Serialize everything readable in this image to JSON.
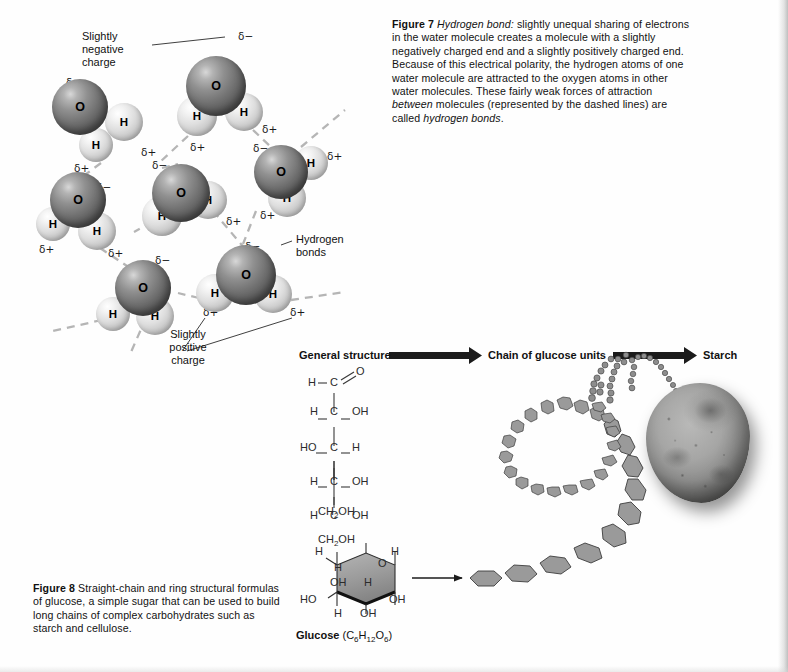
{
  "figure7": {
    "caption_label": "Figure 7",
    "caption_term": "Hydrogen bond:",
    "caption_body_1": " slightly unequal sharing of electrons in the water molecule creates a molecule with a slightly negatively charged end and a slightly positively charged end. Because of this electrical polarity, the hydrogen atoms of one water molecule are attracted to the oxygen atoms in other water molecules. These fairly weak forces of attraction ",
    "caption_italic_2": "between",
    "caption_body_2": " molecules (represented by the dashed lines) are called ",
    "caption_italic_3": "hydrogen bonds",
    "caption_body_3": ".",
    "labels": {
      "negative_charge_line1": "Slightly",
      "negative_charge_line2": "negative",
      "negative_charge_line3": "charge",
      "hydrogen_bonds_line1": "Hydrogen",
      "hydrogen_bonds_line2": "bonds",
      "positive_charge_line1": "Slightly",
      "positive_charge_line2": "positive",
      "positive_charge_line3": "charge"
    },
    "atom_labels": {
      "oxygen": "O",
      "hydrogen": "H"
    },
    "charge_negative": "δ−",
    "charge_positive": "δ+",
    "molecules": [
      {
        "name": "water-molecule-upper-left",
        "ox": 80,
        "oy": 107,
        "or": 28,
        "h": [
          {
            "x": 124,
            "y": 122,
            "r": 19
          },
          {
            "x": 96,
            "y": 145,
            "r": 17
          }
        ]
      },
      {
        "name": "water-molecule-top-center",
        "ox": 216,
        "oy": 86,
        "or": 30,
        "h": [
          {
            "x": 244,
            "y": 112,
            "r": 19
          },
          {
            "x": 197,
            "y": 116,
            "r": 20
          }
        ]
      },
      {
        "name": "water-molecule-right",
        "ox": 281,
        "oy": 172,
        "or": 27,
        "h": [
          {
            "x": 311,
            "y": 163,
            "r": 17
          },
          {
            "x": 287,
            "y": 198,
            "r": 19
          }
        ]
      },
      {
        "name": "water-molecule-center",
        "ox": 181,
        "oy": 193,
        "or": 29,
        "h": [
          {
            "x": 208,
            "y": 200,
            "r": 19
          },
          {
            "x": 162,
            "y": 216,
            "r": 20
          }
        ]
      },
      {
        "name": "water-molecule-mid-left",
        "ox": 78,
        "oy": 200,
        "or": 28,
        "h": [
          {
            "x": 53,
            "y": 224,
            "r": 17
          },
          {
            "x": 97,
            "y": 231,
            "r": 19
          }
        ]
      },
      {
        "name": "water-molecule-bottom-left",
        "ox": 143,
        "oy": 288,
        "or": 28,
        "h": [
          {
            "x": 113,
            "y": 314,
            "r": 17
          },
          {
            "x": 155,
            "y": 316,
            "r": 19
          }
        ]
      },
      {
        "name": "water-molecule-bottom-right",
        "ox": 246,
        "oy": 275,
        "or": 30,
        "h": [
          {
            "x": 215,
            "y": 293,
            "r": 19
          },
          {
            "x": 273,
            "y": 294,
            "r": 19
          }
        ]
      }
    ],
    "charge_marks": [
      {
        "t": "neg",
        "x": 66,
        "y": 76
      },
      {
        "t": "pos",
        "x": 141,
        "y": 146
      },
      {
        "t": "pos",
        "x": 74,
        "y": 162
      },
      {
        "t": "neg",
        "x": 238,
        "y": 30
      },
      {
        "t": "pos",
        "x": 262,
        "y": 123
      },
      {
        "t": "pos",
        "x": 190,
        "y": 141
      },
      {
        "t": "neg",
        "x": 152,
        "y": 159
      },
      {
        "t": "neg",
        "x": 253,
        "y": 142
      },
      {
        "t": "pos",
        "x": 327,
        "y": 150
      },
      {
        "t": "pos",
        "x": 260,
        "y": 209
      },
      {
        "t": "neg",
        "x": 96,
        "y": 181
      },
      {
        "t": "pos",
        "x": 226,
        "y": 215
      },
      {
        "t": "pos",
        "x": 39,
        "y": 243
      },
      {
        "t": "pos",
        "x": 108,
        "y": 247
      },
      {
        "t": "neg",
        "x": 155,
        "y": 254
      },
      {
        "t": "neg",
        "x": 245,
        "y": 240
      },
      {
        "t": "pos",
        "x": 203,
        "y": 306
      },
      {
        "t": "pos",
        "x": 290,
        "y": 306
      }
    ]
  },
  "figure8": {
    "caption_label": "Figure 8",
    "caption_body": " Straight-chain and ring structural formulas of glucose, a simple sugar that can be used to build long chains of complex carbohydrates such as starch and cellulose.",
    "row_headings": [
      {
        "name": "general-structure",
        "text": "General structure"
      },
      {
        "name": "chain-of-glucose-units",
        "text": "Chain of glucose units"
      },
      {
        "name": "starch",
        "text": "Starch"
      }
    ],
    "straight_chain": {
      "rows": [
        {
          "left": "H",
          "center": "C",
          "right": "O",
          "right_is_double": true
        },
        {
          "left": "H",
          "center": "C",
          "right": "OH",
          "right_is_double": false
        },
        {
          "left": "HO",
          "center": "C",
          "right": "H",
          "right_is_double": false
        },
        {
          "left": "H",
          "center": "C",
          "right": "OH",
          "right_is_double": false
        },
        {
          "left": "H",
          "center": "C",
          "right": "OH",
          "right_is_double": false
        }
      ],
      "terminal": "CH2OH",
      "terminal_html": "CH<sub>2</sub>OH"
    },
    "ring": {
      "top_group_html": "CH<sub>2</sub>OH",
      "oxygen": "O",
      "label_left_h": "H",
      "label_right_h": "H",
      "label_inner_h_top": "H",
      "label_inner_oh": "OH",
      "label_inner_h_right": "H",
      "label_ho": "HO",
      "label_right_oh": "OH",
      "label_bottom_h": "H",
      "label_bottom_oh": "OH",
      "name_bold": "Glucose",
      "formula_html": " (C<sub>6</sub>H<sub>12</sub>O<sub>6</sub>)"
    }
  },
  "colors": {
    "page_background": "#fefefe",
    "text": "#111111",
    "oxygen_sphere": "#717171",
    "hydrogen_sphere": "#dedede",
    "hydrogen_bond_dash": "#b5b5b5",
    "arrow_black": "#1b1b1b",
    "hexagon_fill": "#9a9a9a",
    "potato_body": "#a6a6a1"
  }
}
